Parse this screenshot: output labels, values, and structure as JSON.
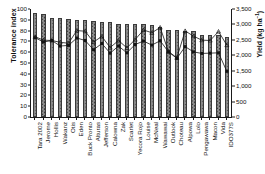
{
  "chart_data": {
    "type": "bar",
    "title": "",
    "xlabel": "",
    "ylabel": "Tolerance index",
    "y2label": "Yield (kg ha-1)",
    "ylim": [
      0,
      100
    ],
    "y2lim": [
      0,
      3500
    ],
    "ytick_labels": [
      "0",
      "10",
      "20",
      "30",
      "40",
      "50",
      "60",
      "70",
      "80",
      "90",
      "100"
    ],
    "ytick_values": [
      0,
      10,
      20,
      30,
      40,
      50,
      60,
      70,
      80,
      90,
      100
    ],
    "y2tick_labels": [
      "0",
      "500",
      "1,000",
      "1,500",
      "2,000",
      "2,500",
      "3,000",
      "3,500"
    ],
    "y2tick_values": [
      0,
      500,
      1000,
      1500,
      2000,
      2500,
      3000,
      3500
    ],
    "grid": false,
    "legend_position": "none",
    "categories": [
      "Tara 2002",
      "Jerome",
      "Hollis",
      "Wakanz",
      "Otis",
      "Eden",
      "Buck Pronto",
      "Alturas",
      "Jefferson",
      "Calowna",
      "Zak",
      "Scarlet",
      "Yecora Rojo",
      "Louise",
      "McNeal",
      "Wawawai",
      "Outlook",
      "Choteau",
      "Alpowa",
      "Lolo",
      "Pengawawa",
      "Macon",
      "Vida",
      "IDO377S"
    ],
    "values": [
      96,
      95,
      92,
      92,
      91,
      90,
      90,
      89,
      88,
      88,
      86,
      86,
      86,
      86,
      85,
      83,
      81,
      81,
      80,
      80,
      76,
      76,
      76,
      74
    ],
    "series": [
      {
        "name": "yield-series-triangle",
        "marker": "triangle",
        "axis": "right",
        "values": [
          2600,
          2490,
          2480,
          2420,
          2390,
          2800,
          2780,
          2430,
          2610,
          2250,
          2480,
          2240,
          2510,
          2820,
          2730,
          2900,
          2120,
          1920,
          2790,
          2620,
          2490,
          2480,
          2770,
          2330
        ]
      },
      {
        "name": "yield-series-square",
        "marker": "square",
        "axis": "right",
        "values": [
          2570,
          2430,
          2480,
          2300,
          2320,
          2560,
          2480,
          2180,
          2380,
          2070,
          2300,
          2080,
          2350,
          2460,
          2330,
          2470,
          2110,
          1900,
          2280,
          2110,
          2060,
          2070,
          2080,
          1480
        ]
      }
    ]
  }
}
